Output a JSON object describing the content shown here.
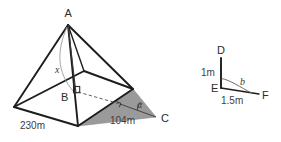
{
  "figure": {
    "colors": {
      "stroke": "#1d1d1d",
      "text": "#2b2b2b",
      "shade_fill": "#9a9a9a",
      "shade_stroke": "#7d7d7d",
      "thin_line": "#6e6e6e",
      "dashed_line": "#4a4a4a",
      "background": "#ffffff"
    },
    "pyramid": {
      "vertices": {
        "apex_label": "A",
        "center_label": "B",
        "corner_label": "C"
      },
      "height_label": "x",
      "angle_label": "α",
      "base_edge_label": "230m",
      "slant_edge_label": "104m"
    },
    "reference": {
      "top_label": "D",
      "corner_label": "E",
      "right_label": "F",
      "vertical_label": "1m",
      "horizontal_label": "1.5m",
      "angle_label": "b"
    }
  }
}
